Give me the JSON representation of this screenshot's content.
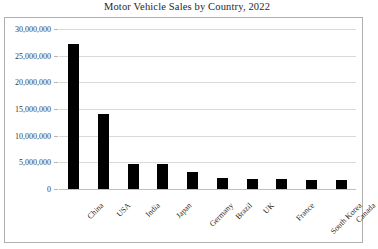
{
  "chart_data": {
    "type": "bar",
    "title": "Motor Vehicle Sales by Country, 2022",
    "xlabel": "",
    "ylabel": "",
    "categories": [
      "China",
      "USA",
      "India",
      "Japan",
      "Germany",
      "Brazil",
      "UK",
      "France",
      "South Korea",
      "Canada"
    ],
    "values": [
      27100000,
      14100000,
      4700000,
      4600000,
      3200000,
      2100000,
      1900000,
      1900000,
      1700000,
      1600000
    ],
    "ylim": [
      0,
      30000000
    ],
    "ytick_values": [
      0,
      5000000,
      10000000,
      15000000,
      20000000,
      25000000,
      30000000
    ],
    "ytick_labels": [
      "0",
      "5,000,000",
      "10,000,000",
      "15,000,000",
      "20,000,000",
      "25,000,000",
      "30,000,000"
    ],
    "grid": true,
    "legend": false,
    "legend_position": "none",
    "bar_color": "#000000",
    "gridline_color": "#d9d9d9",
    "frame_color": "#b0b0b0",
    "title_color": "#262626"
  }
}
